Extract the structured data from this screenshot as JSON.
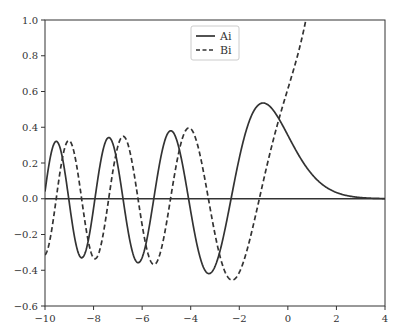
{
  "chart_data": {
    "type": "line",
    "title": "",
    "xlabel": "",
    "ylabel": "",
    "xlim": [
      -10,
      4
    ],
    "ylim": [
      -0.6,
      1.0
    ],
    "xticks": [
      -10,
      -8,
      -6,
      -4,
      -2,
      0,
      2,
      4
    ],
    "yticks": [
      -0.6,
      -0.4,
      -0.2,
      0.0,
      0.2,
      0.4,
      0.6,
      0.8,
      1.0
    ],
    "xtick_labels": [
      "−10",
      "−8",
      "−6",
      "−4",
      "−2",
      "0",
      "2",
      "4"
    ],
    "ytick_labels": [
      "−0.6",
      "−0.4",
      "−0.2",
      "0.0",
      "0.2",
      "0.4",
      "0.6",
      "0.8",
      "1.0"
    ],
    "grid": false,
    "legend_position": "upper center",
    "zero_line": true,
    "series": [
      {
        "name": "Ai",
        "style": "solid",
        "color": "#333333",
        "x": [
          -10,
          -9.5,
          -9,
          -8.5,
          -8,
          -7.5,
          -7,
          -6.5,
          -6,
          -5.5,
          -5,
          -4.5,
          -4,
          -3.5,
          -3,
          -2.5,
          -2,
          -1.5,
          -1,
          -0.5,
          0,
          0.5,
          1,
          1.5,
          2,
          2.5,
          3,
          3.5,
          4
        ],
        "values": [
          0.0424,
          0.3132,
          -0.0221,
          -0.3302,
          0.053,
          0.3295,
          -0.075,
          -0.3448,
          0.3301,
          0.0262,
          0.3507,
          -0.2009,
          -0.0702,
          0.3692,
          -0.3788,
          0.1581,
          0.2274,
          0.4642,
          0.5356,
          0.4757,
          0.355,
          0.2317,
          0.1353,
          0.0717,
          0.0349,
          0.0157,
          0.0066,
          0.0025,
          0.001
        ]
      },
      {
        "name": "Bi",
        "style": "dashed",
        "color": "#333333",
        "x": [
          -10,
          -9.5,
          -9,
          -8.5,
          -8,
          -7.5,
          -7,
          -6.5,
          -6,
          -5.5,
          -5,
          -4.5,
          -4,
          -3.5,
          -3,
          -2.5,
          -2,
          -1.5,
          -1,
          -0.5,
          0,
          0.5,
          1,
          1.5,
          2
        ],
        "values": [
          -0.3147,
          -0.0586,
          0.3242,
          -0.0155,
          -0.3252,
          0.0793,
          0.2938,
          -0.188,
          -0.1466,
          0.3361,
          -0.1383,
          -0.3344,
          0.3922,
          -0.166,
          -0.1983,
          -0.4113,
          -0.4123,
          -0.1918,
          0.104,
          0.3803,
          0.6149,
          0.8542,
          1.2074,
          1.8789,
          3.2981
        ]
      }
    ]
  }
}
